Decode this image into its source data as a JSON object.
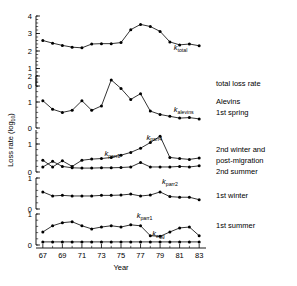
{
  "chart_data": {
    "type": "line",
    "title": "",
    "xlabel": "Year",
    "ylabel": "Loss rate (log10)",
    "ylabel_base": "Loss rate (log",
    "ylabel_sub": "10",
    "ylabel_close": ")",
    "x": [
      67,
      68,
      69,
      70,
      71,
      72,
      73,
      74,
      75,
      76,
      77,
      78,
      79,
      80,
      81,
      82,
      83
    ],
    "xtick_labels": [
      "67",
      "69",
      "71",
      "73",
      "75",
      "77",
      "79",
      "81",
      "83"
    ],
    "xtick_values": [
      67,
      69,
      71,
      73,
      75,
      77,
      79,
      81,
      83
    ],
    "xlim": [
      66.3,
      83.7
    ],
    "grid": false,
    "legend_position": "right",
    "panels": [
      {
        "name": "panel-total",
        "ylim": [
          0,
          4
        ],
        "yticks": [
          0,
          1,
          2,
          3,
          4
        ],
        "ytick_labels": [
          "0",
          "1",
          "2",
          "3",
          "4"
        ],
        "minor_step": 0.2,
        "right_labels": [
          "total loss rate"
        ],
        "series": [
          {
            "name": "k_total",
            "tag_base": "k",
            "tag_sub": "total",
            "tag_x": 80.4,
            "tag_y": 2.05,
            "values": [
              2.6,
              2.45,
              2.32,
              2.22,
              2.18,
              2.4,
              2.42,
              2.42,
              2.48,
              3.22,
              3.52,
              3.4,
              3.12,
              2.52,
              2.35,
              2.4,
              2.3
            ]
          }
        ]
      },
      {
        "name": "panel-alevins",
        "ylim": [
          0,
          2
        ],
        "yticks": [
          0,
          1,
          2
        ],
        "ytick_labels": [
          "0",
          "1",
          "2"
        ],
        "minor_step": 0.2,
        "right_labels": [
          "Alevins",
          "1st spring"
        ],
        "series": [
          {
            "name": "k_alevins",
            "tag_base": "k",
            "tag_sub": "alevins",
            "tag_x": 80.4,
            "tag_y": 0.62,
            "values": [
              1.05,
              0.72,
              0.6,
              0.68,
              1.05,
              0.68,
              0.85,
              1.85,
              1.52,
              1.1,
              1.32,
              0.65,
              0.52,
              0.45,
              0.38,
              0.4,
              0.35
            ]
          }
        ]
      },
      {
        "name": "panel-parr34",
        "ylim": [
          0,
          1.5
        ],
        "yticks": [
          0,
          1
        ],
        "ytick_labels": [
          "0",
          "1"
        ],
        "minor_step": 0.2,
        "right_labels": [
          "2nd winter and",
          "post-migration",
          "2nd summer"
        ],
        "series": [
          {
            "name": "k_parr4",
            "tag_base": "k",
            "tag_sub": "parr4",
            "tag_x": 77.6,
            "tag_y": 1.16,
            "values": [
              0.42,
              0.18,
              0.4,
              0.2,
              0.42,
              0.46,
              0.48,
              0.52,
              0.6,
              0.7,
              0.85,
              1.05,
              1.28,
              0.52,
              0.48,
              0.45,
              0.5
            ]
          },
          {
            "name": "k_parr3",
            "tag_base": "k",
            "tag_sub": "parr3",
            "tag_x": 73.3,
            "tag_y": 0.58,
            "values": [
              0.18,
              0.38,
              0.2,
              0.15,
              0.14,
              0.14,
              0.15,
              0.15,
              0.16,
              0.18,
              0.34,
              0.18,
              0.18,
              0.18,
              0.2,
              0.18,
              0.22
            ]
          }
        ]
      },
      {
        "name": "panel-parr2",
        "ylim": [
          0,
          1
        ],
        "yticks": [
          0,
          1
        ],
        "ytick_labels": [
          "0",
          "1"
        ],
        "minor_step": 0.2,
        "right_labels": [
          "1st winter"
        ],
        "series": [
          {
            "name": "k_parr2",
            "tag_base": "k",
            "tag_sub": "parr2",
            "tag_x": 79.2,
            "tag_y": 0.8,
            "values": [
              0.55,
              0.42,
              0.44,
              0.42,
              0.42,
              0.42,
              0.44,
              0.44,
              0.45,
              0.48,
              0.42,
              0.45,
              0.55,
              0.4,
              0.38,
              0.38,
              0.3
            ]
          }
        ]
      },
      {
        "name": "panel-parr1-egg",
        "ylim": [
          0,
          1
        ],
        "yticks": [
          0,
          1
        ],
        "ytick_labels": [
          "0",
          "1"
        ],
        "minor_step": 0.2,
        "right_labels": [
          "1st summer"
        ],
        "series": [
          {
            "name": "k_parr1",
            "tag_base": "k",
            "tag_sub": "parr1",
            "tag_x": 76.6,
            "tag_y": 0.88,
            "values": [
              0.42,
              0.62,
              0.72,
              0.75,
              0.62,
              0.52,
              0.58,
              0.62,
              0.58,
              0.65,
              0.62,
              0.3,
              0.28,
              0.42,
              0.55,
              0.58,
              0.3
            ]
          },
          {
            "name": "k_egg",
            "tag_base": "k",
            "tag_sub": "egg",
            "tag_x": 78.2,
            "tag_y": 0.3,
            "values": [
              0.1,
              0.1,
              0.1,
              0.1,
              0.1,
              0.1,
              0.1,
              0.1,
              0.1,
              0.1,
              0.1,
              0.1,
              0.1,
              0.1,
              0.1,
              0.1,
              0.1
            ]
          }
        ]
      }
    ]
  }
}
